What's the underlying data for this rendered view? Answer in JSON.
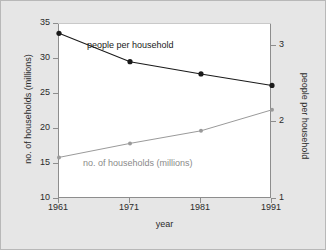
{
  "figure": {
    "background_color": "#e6e6e6",
    "plot_background_color": "#ffffff",
    "border_color": "#b8b8b8"
  },
  "axes": {
    "x": {
      "label": "year",
      "ticks": [
        "1961",
        "1971",
        "1981",
        "1991"
      ],
      "values": [
        1961,
        1971,
        1981,
        1991
      ],
      "min": 1961,
      "max": 1991
    },
    "y_left": {
      "label": "no. of households (millions)",
      "ticks": [
        "10",
        "15",
        "20",
        "25",
        "30",
        "35"
      ],
      "values": [
        10,
        15,
        20,
        25,
        30,
        35
      ],
      "min": 10,
      "max": 35
    },
    "y_right": {
      "label": "people per household",
      "ticks": [
        "1",
        "2",
        "3"
      ],
      "values": [
        1,
        2,
        3
      ],
      "min": 1,
      "max": 3.285
    }
  },
  "annotations": {
    "people_per_household": "people per household",
    "no_of_households": "no. of households (millions)"
  },
  "colors": {
    "people_per_household": "#1a1a1a",
    "no_of_households": "#9a9a9a",
    "axis": "#8d8d8d",
    "text": "#2b2b2b"
  },
  "chart_data": {
    "type": "line",
    "title": "",
    "xlabel": "year",
    "ylabel": "no. of households (millions)",
    "ylabel_secondary": "people per household",
    "x": [
      1961,
      1971,
      1981,
      1991
    ],
    "categories": [
      "1961",
      "1971",
      "1981",
      "1991"
    ],
    "xlim": [
      1961,
      1991
    ],
    "ylim": [
      10,
      35
    ],
    "ylim_secondary": [
      1,
      3.285
    ],
    "grid": false,
    "legend": "inline-annotations",
    "series": [
      {
        "name": "people per household",
        "axis": "right",
        "color": "#1a1a1a",
        "marker": "filled-circle",
        "values": [
          3.15,
          2.78,
          2.62,
          2.47
        ]
      },
      {
        "name": "no. of households (millions)",
        "axis": "left",
        "color": "#9a9a9a",
        "marker": "filled-circle-small",
        "values": [
          15.8,
          17.8,
          19.6,
          22.6
        ]
      }
    ]
  }
}
